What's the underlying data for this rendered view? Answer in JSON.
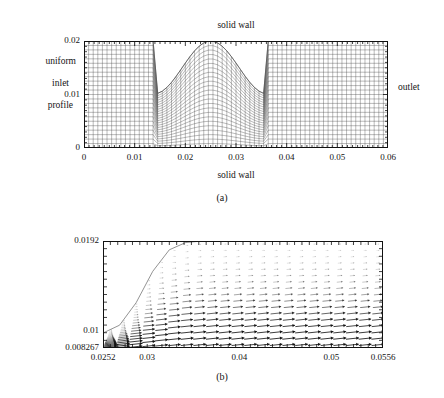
{
  "figure": {
    "panels": [
      {
        "id": "a",
        "caption": "(a)",
        "description": "computational mesh of a 2D channel with a constriction (bump) on the upper wall",
        "labels": {
          "top_wall": "solid wall",
          "bottom_wall": "solid wall",
          "inlet_line1": "uniform",
          "inlet_line2": "inlet",
          "inlet_line3": "profile",
          "outlet": "outlet"
        },
        "x_ticks": [
          "0",
          "0.01",
          "0.02",
          "0.03",
          "0.04",
          "0.05",
          "0.06"
        ],
        "y_ticks": [
          "0",
          "0.01",
          "0.02"
        ]
      },
      {
        "id": "b",
        "caption": "(b)",
        "description": "velocity vector field in the region downstream of the constriction",
        "x_ticks": [
          "0.0252",
          "0.03",
          "0.04",
          "0.05",
          "0.0556"
        ],
        "y_ticks": [
          "0.008267",
          "0.01",
          "0.0192"
        ]
      }
    ]
  },
  "chart_data": [
    {
      "type": "mesh",
      "panel": "a",
      "title": "",
      "xlabel": "solid wall",
      "ylabel": "",
      "xlim": [
        0,
        0.06
      ],
      "ylim": [
        0,
        0.02
      ],
      "xticks": [
        0,
        0.01,
        0.02,
        0.03,
        0.04,
        0.05,
        0.06
      ],
      "yticks": [
        0,
        0.01,
        0.02
      ],
      "grid": false,
      "mesh": {
        "nx": 66,
        "ny": 24,
        "domain_x": [
          0,
          0.06
        ],
        "domain_y_bottom": 0.0,
        "domain_y_top_flat": 0.02,
        "bump": {
          "shape": "cosine constriction on upper wall",
          "x_start": 0.0138,
          "x_end": 0.0362,
          "x_center": 0.025,
          "y_min_at_center": 0.0101,
          "y_outside": 0.02
        }
      },
      "annotations": [
        {
          "text": "solid wall",
          "position": "top-center"
        },
        {
          "text": "solid wall",
          "position": "bottom-center"
        },
        {
          "text": "uniform inlet profile",
          "position": "left"
        },
        {
          "text": "outlet",
          "position": "right"
        }
      ]
    },
    {
      "type": "quiver",
      "panel": "b",
      "title": "",
      "xlabel": "",
      "ylabel": "",
      "xlim": [
        0.0252,
        0.0556
      ],
      "ylim": [
        0.008267,
        0.0192
      ],
      "xticks": [
        0.0252,
        0.03,
        0.04,
        0.05,
        0.0556
      ],
      "yticks": [
        0.008267,
        0.01,
        0.0192
      ],
      "grid": false,
      "wall_curve": {
        "description": "downstream face of the bump rising from the constriction throat to the flat upper wall",
        "x": [
          0.0252,
          0.027,
          0.0288,
          0.0306,
          0.0324,
          0.0342,
          0.036,
          0.038
        ],
        "y": [
          0.0098,
          0.0106,
          0.0129,
          0.0161,
          0.0183,
          0.01905,
          0.0192,
          0.0192
        ]
      },
      "vector_rows": {
        "description": "rows of velocity vectors; magnitude largest near the lower wall and smallest near the upper wall",
        "n_rows": 17,
        "n_cols": 22,
        "magnitude_by_row_top_to_bottom": [
          0.05,
          0.08,
          0.12,
          0.16,
          0.22,
          0.28,
          0.35,
          0.44,
          0.54,
          0.64,
          0.74,
          0.83,
          0.9,
          0.95,
          0.99,
          1.0,
          0.97
        ],
        "direction_deg_from_x_axis": 6
      }
    }
  ]
}
